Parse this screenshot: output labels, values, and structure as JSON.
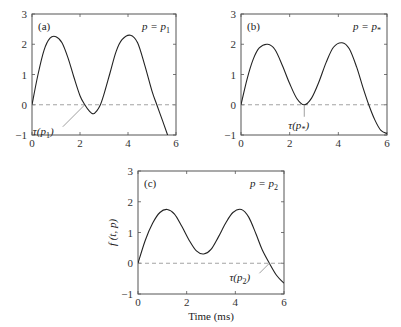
{
  "figure": {
    "xlabel": "Time (ms)",
    "ylabel": "f (t, p)"
  },
  "panels": [
    {
      "tag": "(a)",
      "param": "p = p",
      "param_sub": "1",
      "tau": "τ(p",
      "tau_sub": "1",
      "tau_close": ")"
    },
    {
      "tag": "(b)",
      "param": "p = p",
      "param_sub": "*",
      "tau": "τ(p",
      "tau_sub": "*",
      "tau_close": ")"
    },
    {
      "tag": "(c)",
      "param": "p = p",
      "param_sub": "2",
      "tau": "τ(p",
      "tau_sub": "2",
      "tau_close": ")"
    }
  ],
  "chart_data": [
    {
      "type": "line",
      "title": "(a) p = p1",
      "xlabel": "",
      "ylabel": "",
      "xlim": [
        0,
        6
      ],
      "ylim": [
        -1,
        3
      ],
      "xticks": [
        0,
        2,
        4,
        6
      ],
      "yticks": [
        -1,
        0,
        1,
        2,
        3
      ],
      "grid": false,
      "reference_line": {
        "y": 0,
        "style": "dashed"
      },
      "annotation": {
        "text": "τ(p1)",
        "x": 2.2,
        "y": 0
      },
      "series": [
        {
          "name": "f(t, p1)",
          "x": [
            0,
            0.25,
            0.5,
            0.75,
            1.0,
            1.25,
            1.5,
            1.75,
            2.0,
            2.2,
            2.4,
            2.55,
            2.7,
            2.85,
            3.0,
            3.25,
            3.5,
            3.75,
            4.1,
            4.4,
            4.7,
            5.0,
            5.2,
            5.45,
            5.65
          ],
          "y": [
            0,
            1.0,
            1.8,
            2.2,
            2.25,
            2.05,
            1.55,
            0.9,
            0.3,
            0.0,
            -0.22,
            -0.3,
            -0.2,
            0.0,
            0.35,
            1.05,
            1.75,
            2.15,
            2.3,
            2.05,
            1.3,
            0.45,
            0.0,
            -0.55,
            -1.0
          ]
        }
      ]
    },
    {
      "type": "line",
      "title": "(b) p = p*",
      "xlabel": "",
      "ylabel": "",
      "xlim": [
        0,
        6
      ],
      "ylim": [
        -1,
        3
      ],
      "xticks": [
        0,
        2,
        4,
        6
      ],
      "yticks": [
        -1,
        0,
        1,
        2,
        3
      ],
      "grid": false,
      "reference_line": {
        "y": 0,
        "style": "dashed"
      },
      "annotation": {
        "text": "τ(p*)",
        "x": 2.6,
        "y": 0
      },
      "series": [
        {
          "name": "f(t, p*)",
          "x": [
            0,
            0.25,
            0.5,
            0.75,
            1.1,
            1.4,
            1.7,
            2.0,
            2.3,
            2.6,
            2.9,
            3.2,
            3.5,
            3.8,
            4.15,
            4.45,
            4.75,
            5.0,
            5.25,
            5.5,
            5.75,
            6.0
          ],
          "y": [
            0,
            0.85,
            1.5,
            1.88,
            2.0,
            1.82,
            1.3,
            0.7,
            0.2,
            0.0,
            0.22,
            0.75,
            1.4,
            1.9,
            2.05,
            1.85,
            1.25,
            0.6,
            0.0,
            -0.5,
            -0.85,
            -0.95
          ]
        }
      ]
    },
    {
      "type": "line",
      "title": "(c) p = p2",
      "xlabel": "Time (ms)",
      "ylabel": "f(t, p)",
      "xlim": [
        0,
        6
      ],
      "ylim": [
        -1,
        3
      ],
      "xticks": [
        0,
        2,
        4,
        6
      ],
      "yticks": [
        -1,
        0,
        1,
        2,
        3
      ],
      "grid": false,
      "reference_line": {
        "y": 0,
        "style": "dashed"
      },
      "annotation": {
        "text": "τ(p2)",
        "x": 5.4,
        "y": 0
      },
      "series": [
        {
          "name": "f(t, p2)",
          "x": [
            0,
            0.3,
            0.6,
            0.9,
            1.2,
            1.5,
            1.8,
            2.1,
            2.4,
            2.7,
            3.0,
            3.3,
            3.6,
            3.9,
            4.25,
            4.55,
            4.85,
            5.1,
            5.4,
            5.7,
            6.0
          ],
          "y": [
            0,
            0.75,
            1.3,
            1.65,
            1.75,
            1.6,
            1.2,
            0.75,
            0.4,
            0.3,
            0.45,
            0.85,
            1.3,
            1.65,
            1.75,
            1.5,
            0.95,
            0.45,
            0.0,
            -0.4,
            -0.65
          ]
        }
      ]
    }
  ]
}
